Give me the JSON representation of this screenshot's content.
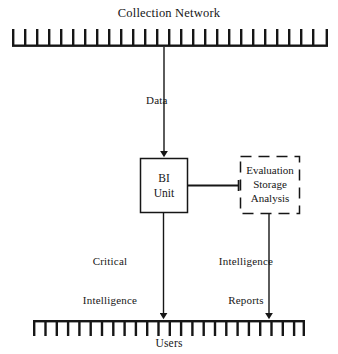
{
  "diagram": {
    "type": "flow-diagram",
    "title": "",
    "background_color": "#ffffff",
    "stroke_color": "#161616",
    "nodes": {
      "collection_network": {
        "label": "Collection Network",
        "shape": "comb-bar",
        "teeth": 27,
        "tick_direction": "up"
      },
      "bi_unit": {
        "line1": "BI",
        "line2": "Unit",
        "shape": "rectangle",
        "border": "solid"
      },
      "evaluation_storage_analysis": {
        "line1": "Evaluation",
        "line2": "Storage",
        "line3": "Analysis",
        "shape": "rectangle",
        "border": "dashed"
      },
      "users": {
        "label": "Users",
        "shape": "comb-bar",
        "teeth": 25,
        "tick_direction": "down"
      }
    },
    "edges": {
      "data": {
        "label": "Data",
        "from": "collection_network",
        "to": "bi_unit",
        "arrow": "down"
      },
      "bi_to_esa": {
        "label": "",
        "from": "bi_unit",
        "to": "evaluation_storage_analysis",
        "arrow": "none"
      },
      "critical_intelligence": {
        "line1": "Critical",
        "line2": "Intelligence",
        "from": "bi_unit",
        "to": "users",
        "arrow": "down"
      },
      "intelligence_reports": {
        "line1": "Intelligence",
        "line2": "Reports",
        "from": "evaluation_storage_analysis",
        "to": "users",
        "arrow": "down"
      }
    }
  }
}
